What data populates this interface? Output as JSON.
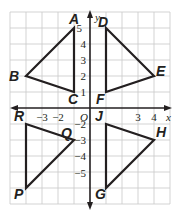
{
  "plane": {
    "x_range": [
      -5,
      5
    ],
    "y_range": [
      -6,
      6
    ],
    "origin_label": "O",
    "x_axis_label": "x",
    "y_axis_label": "y",
    "x_ticks": [
      {
        "value": -3,
        "label": "−3"
      },
      {
        "value": -2,
        "label": "−2"
      },
      {
        "value": 3,
        "label": "3"
      },
      {
        "value": 4,
        "label": "4"
      }
    ],
    "y_ticks": [
      {
        "value": 5,
        "label": "5"
      },
      {
        "value": 4,
        "label": "4"
      },
      {
        "value": 3,
        "label": "3"
      },
      {
        "value": 2,
        "label": "2"
      },
      {
        "value": 1,
        "label": "1"
      },
      {
        "value": -2,
        "label": "−2"
      },
      {
        "value": -3,
        "label": "−3"
      },
      {
        "value": -4,
        "label": "−4"
      },
      {
        "value": -5,
        "label": "−5"
      }
    ]
  },
  "triangles": [
    {
      "name": "ABC",
      "vertices": [
        {
          "label": "A",
          "x": -1,
          "y": 5
        },
        {
          "label": "B",
          "x": -4,
          "y": 2
        },
        {
          "label": "C",
          "x": -1,
          "y": 1
        }
      ]
    },
    {
      "name": "DEF",
      "vertices": [
        {
          "label": "D",
          "x": 1,
          "y": 5
        },
        {
          "label": "E",
          "x": 4,
          "y": 2
        },
        {
          "label": "F",
          "x": 1,
          "y": 1
        }
      ]
    },
    {
      "name": "PQR",
      "vertices": [
        {
          "label": "R",
          "x": -4,
          "y": -1
        },
        {
          "label": "Q",
          "x": -1,
          "y": -2
        },
        {
          "label": "P",
          "x": -4,
          "y": -5
        }
      ]
    },
    {
      "name": "GHJ",
      "vertices": [
        {
          "label": "J",
          "x": 1,
          "y": -1
        },
        {
          "label": "H",
          "x": 4,
          "y": -2
        },
        {
          "label": "G",
          "x": 1,
          "y": -5
        }
      ]
    }
  ],
  "labels": {
    "A": "A",
    "B": "B",
    "C": "C",
    "D": "D",
    "E": "E",
    "F": "F",
    "P": "P",
    "Q": "Q",
    "R": "R",
    "G": "G",
    "H": "H",
    "J": "J"
  },
  "colors": {
    "grid": "#c8c8c8",
    "ink": "#231f20",
    "background": "#ffffff"
  }
}
